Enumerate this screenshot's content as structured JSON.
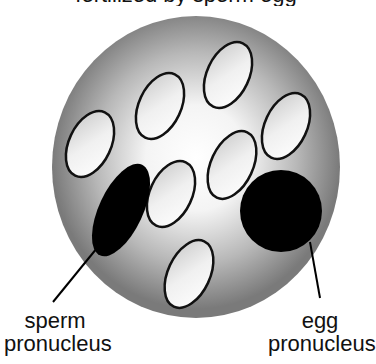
{
  "diagram": {
    "title_partial": "fertilized by sperm     egg",
    "cell": {
      "cx": 196,
      "cy": 167,
      "rx": 144,
      "ry": 151,
      "gradient_inner": "#ffffff",
      "gradient_outer": "#7a7a7a"
    },
    "organelles": [
      {
        "cx": 90,
        "cy": 144,
        "rx": 21,
        "ry": 35,
        "rotate": 25
      },
      {
        "cx": 160,
        "cy": 106,
        "rx": 21,
        "ry": 35,
        "rotate": 25
      },
      {
        "cx": 228,
        "cy": 75,
        "rx": 21,
        "ry": 35,
        "rotate": 25
      },
      {
        "cx": 286,
        "cy": 126,
        "rx": 21,
        "ry": 35,
        "rotate": 25
      },
      {
        "cx": 232,
        "cy": 165,
        "rx": 21,
        "ry": 36,
        "rotate": 25
      },
      {
        "cx": 171,
        "cy": 194,
        "rx": 21,
        "ry": 35,
        "rotate": 25
      },
      {
        "cx": 189,
        "cy": 274,
        "rx": 21,
        "ry": 36,
        "rotate": 25
      }
    ],
    "sperm_pronucleus": {
      "cx": 121,
      "cy": 210,
      "rx": 22,
      "ry": 50,
      "rotate": 25,
      "color": "#000000"
    },
    "egg_pronucleus": {
      "cx": 281,
      "cy": 211,
      "r": 41,
      "color": "#000000"
    },
    "labels": {
      "sperm_line1": "sperm",
      "sperm_line2": "pronucleus",
      "egg_line1": "egg",
      "egg_line2": "pronucleus"
    }
  }
}
